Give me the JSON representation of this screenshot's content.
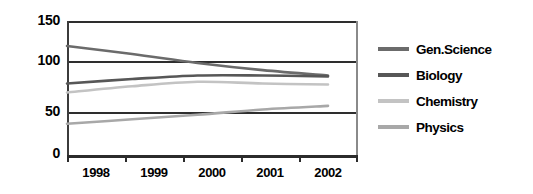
{
  "chart_data": {
    "type": "line",
    "title": "",
    "xlabel": "",
    "ylabel": "",
    "x": [
      "1998",
      "1999",
      "2000",
      "2001",
      "2002"
    ],
    "categories": [
      "1998",
      "1999",
      "2000",
      "2001",
      "2002"
    ],
    "xtick_labels": [
      "1998",
      "1999",
      "2000",
      "2001",
      "2002"
    ],
    "ytick_labels": [
      "0",
      "50",
      "100",
      "150"
    ],
    "yticks": [
      0,
      50,
      100,
      150
    ],
    "ylim": [
      0,
      150
    ],
    "grid": true,
    "grid_axis": "y",
    "legend_position": "right",
    "series": [
      {
        "name": "Gen.Science",
        "color": "#6b6b6b",
        "values": [
          122,
          113,
          103,
          95,
          89
        ]
      },
      {
        "name": "Biology",
        "color": "#575757",
        "values": [
          80,
          85,
          89,
          89,
          88
        ]
      },
      {
        "name": "Chemistry",
        "color": "#c3c3c3",
        "values": [
          70,
          77,
          82,
          80,
          79
        ]
      },
      {
        "name": "Physics",
        "color": "#a8a8a8",
        "values": [
          35,
          40,
          45,
          51,
          55
        ]
      }
    ]
  },
  "legend": {
    "items": [
      {
        "label": "Gen.Science",
        "color": "#6b6b6b"
      },
      {
        "label": "Biology",
        "color": "#575757"
      },
      {
        "label": "Chemistry",
        "color": "#c3c3c3"
      },
      {
        "label": "Physics",
        "color": "#a8a8a8"
      }
    ]
  },
  "axes": {
    "y_tick_0": "0",
    "y_tick_1": "50",
    "y_tick_2": "100",
    "y_tick_3": "150",
    "x_tick_0": "1998",
    "x_tick_1": "1999",
    "x_tick_2": "2000",
    "x_tick_3": "2001",
    "x_tick_4": "2002"
  }
}
